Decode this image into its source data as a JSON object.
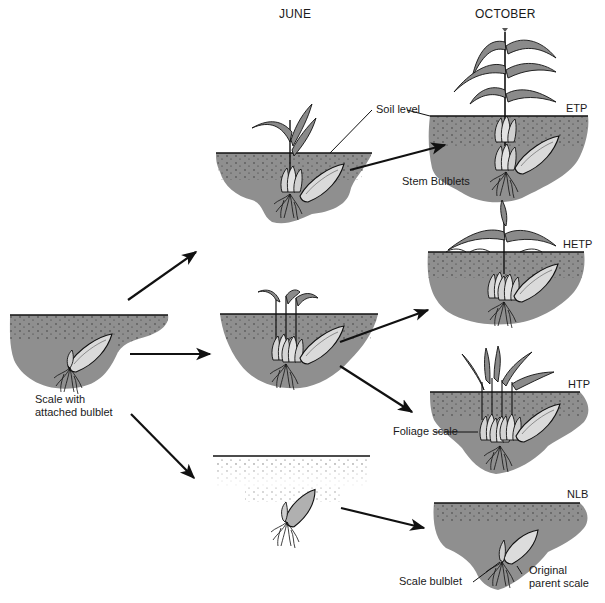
{
  "headers": {
    "june": "JUNE",
    "october": "OCTOBER"
  },
  "labels": {
    "soil_level": "Soil level",
    "stem_bulblets": "Stem Bulblets",
    "etp": "ETP",
    "hetp": "HETP",
    "htp": "HTP",
    "nlb": "NLB",
    "foliage_scale": "Foliage scale",
    "scale_with_line1": "Scale with",
    "scale_with_line2": "attached bulblet",
    "scale_bulblet": "Scale bulblet",
    "original_line1": "Original",
    "original_line2": "parent scale"
  },
  "colors": {
    "soil": "#8f8f8f",
    "ink": "#111111",
    "leaf": "#8a8a8a",
    "scale": "#d8d8d8",
    "background": "#ffffff"
  },
  "stages": [
    {
      "id": "start",
      "label": "Scale with attached bulblet"
    },
    {
      "id": "june-etp-path",
      "column": "JUNE"
    },
    {
      "id": "june-hetp-path",
      "column": "JUNE"
    },
    {
      "id": "june-nlb-path",
      "column": "JUNE"
    },
    {
      "id": "oct-etp",
      "column": "OCTOBER",
      "code": "ETP"
    },
    {
      "id": "oct-hetp",
      "column": "OCTOBER",
      "code": "HETP"
    },
    {
      "id": "oct-htp",
      "column": "OCTOBER",
      "code": "HTP"
    },
    {
      "id": "oct-nlb",
      "column": "OCTOBER",
      "code": "NLB"
    }
  ]
}
